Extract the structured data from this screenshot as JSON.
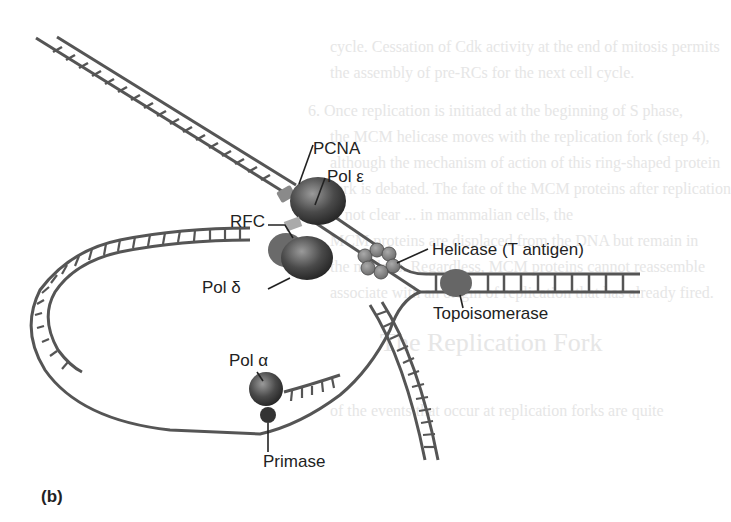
{
  "figure": {
    "panel_label": "(b)",
    "labels": {
      "pcna": "PCNA",
      "pol_epsilon": "Pol ε",
      "rfc": "RFC",
      "pol_delta": "Pol δ",
      "helicase": "Helicase (T antigen)",
      "topoisomerase": "Topoisomerase",
      "pol_alpha": "Pol α",
      "primase": "Primase"
    },
    "colors": {
      "dna_strand": "#555555",
      "protein_dark": "#3a3a3a",
      "protein_mid": "#777777",
      "helicase": "#888888",
      "text": "#222222",
      "bleed_text": "#e6e6e6"
    }
  },
  "bleed_through_text": {
    "line1": "cycle. Cessation of Cdk activity at the end of mitosis permits",
    "line2": "the assembly of pre-RCs for the next cell cycle.",
    "line3": "6.  Once replication is initiated at the beginning of S phase,",
    "line4": "the MCM helicase moves with the replication fork (step 4),",
    "line5": "although the mechanism of action of this ring-shaped protein",
    "line6": "fork is debated. The fate of the MCM proteins after replication",
    "line7": "is not clear ... in mammalian cells, the",
    "line8": "MCM proteins are displaced from the DNA but remain in",
    "line9": "the nucleus. Regardless, MCM proteins cannot reassemble",
    "line10": "associate with an origin of replication that has already fired.",
    "heading": "The Replication Fork",
    "line11": "of the events that occur at replication forks are quite"
  }
}
